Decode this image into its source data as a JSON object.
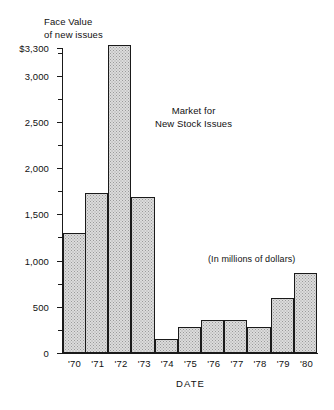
{
  "chart_data": {
    "type": "bar",
    "title_line1": "Market for",
    "title_line2": "New Stock Issues",
    "subtitle": "(In millions of dollars)",
    "ylabel": "Face Value\nof new issues",
    "ylabel_line1": "Face Value",
    "ylabel_line2": "of new issues",
    "xlabel": "DATE",
    "categories": [
      "'70",
      "'71",
      "'72",
      "'73",
      "'74",
      "'75",
      "'76",
      "'77",
      "'78",
      "'79",
      "'80"
    ],
    "values": [
      1300,
      1730,
      3330,
      1690,
      150,
      280,
      360,
      360,
      280,
      600,
      870
    ],
    "ylim": [
      0,
      3300
    ],
    "ytick_labels": [
      "$3,300",
      "3,000",
      "2,500",
      "2,000",
      "1,500",
      "1,000",
      "500",
      "0"
    ],
    "ytick_values": [
      3300,
      3000,
      2500,
      2000,
      1500,
      1000,
      500,
      0
    ],
    "yminor_values": [
      3250,
      2750,
      2250,
      1750,
      1250,
      750,
      250
    ],
    "grid": false,
    "legend": null,
    "bar_fill_color": "#dcdcdc",
    "bar_edge_color": "#1a1a1a",
    "axis_color": "#1a1a1a",
    "background_color": "#ffffff"
  }
}
